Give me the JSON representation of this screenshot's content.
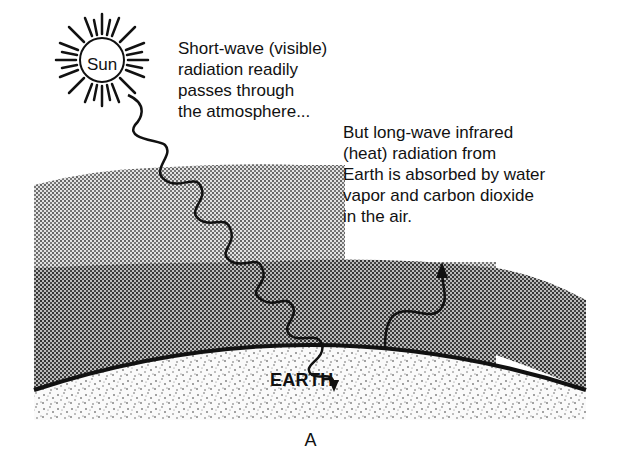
{
  "diagram": {
    "sun_label": "Sun",
    "earth_label": "EARTH",
    "caption": "A",
    "shortwave_text": [
      "Short-wave (visible)",
      "radiation readily",
      "passes through",
      "the atmosphere..."
    ],
    "longwave_text": [
      "But long-wave infrared",
      "(heat) radiation from",
      " Earth is absorbed by water",
      "vapor and carbon dioxide",
      "in the air."
    ],
    "colors": {
      "ink": "#111111",
      "upper_atmosphere": "#bdbdbd",
      "lower_atmosphere": "#8f8f8f",
      "earth_fill": "#f2f2f2"
    }
  }
}
